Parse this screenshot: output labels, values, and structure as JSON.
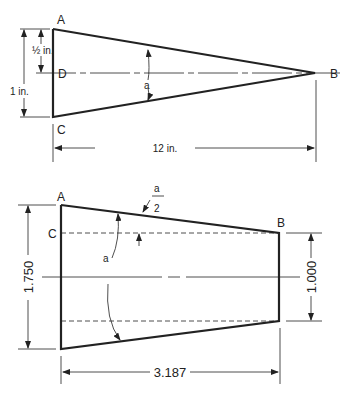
{
  "diagram_top": {
    "points": {
      "A": "A",
      "B": "B",
      "C": "C",
      "D": "D"
    },
    "angle_label": "a",
    "dim_half": "½ in.",
    "dim_height": "1 in.",
    "dim_length": "12 in."
  },
  "diagram_bottom": {
    "points": {
      "A": "A",
      "B": "B",
      "C": "C"
    },
    "angle_label": "a",
    "half_angle_num": "a",
    "half_angle_den": "2",
    "dim_large": "1.750",
    "dim_small": "1.000",
    "dim_length": "3.187"
  },
  "colors": {
    "line": "#222222",
    "background": "#ffffff"
  }
}
